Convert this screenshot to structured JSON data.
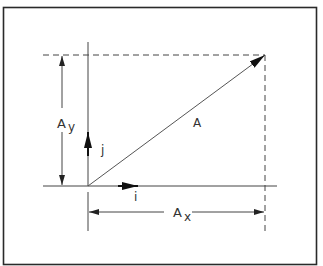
{
  "diagram": {
    "vector_label": "A",
    "component_x": {
      "base": "A",
      "sub": "x"
    },
    "component_y": {
      "base": "A",
      "sub": "y"
    },
    "unit_x_label": "i",
    "unit_y_label": "j",
    "colors": {
      "line": "#3a3a3a",
      "border": "#2a2a2a",
      "background": "#ffffff"
    }
  }
}
